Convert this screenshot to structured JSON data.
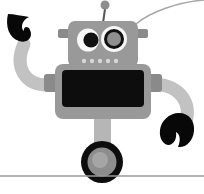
{
  "image": {
    "title": "Cartoon robot on one wheel",
    "subject": "robot",
    "width": 204,
    "height": 194,
    "background_color": "#ffffff",
    "style": "flat grayscale vector illustration"
  },
  "palette": {
    "background": "#ffffff",
    "body_gray": "#999999",
    "body_gray_dark": "#8a8a8a",
    "limb_gray": "#c2c2c2",
    "limb_gray_dark": "#b0b0b0",
    "screen_black": "#0d0d0d",
    "claw_black": "#080808",
    "eye_white": "#f7f7f7",
    "pupil_black": "#111111",
    "lens_gray": "#8f8f8f",
    "dot_gray": "#d6d6d6",
    "wheel_tire": "#0d0d0d",
    "wheel_hub": "#8d8d8d",
    "wheel_hub_light": "#a5a5a5",
    "ground_line": "#9a9a9a",
    "wire_gray": "#a8a8a8",
    "antenna_stem": "#555555",
    "antenna_ball": "#8d8d8d"
  },
  "parts": {
    "antenna": {
      "label": "antenna",
      "ball_cx": 105,
      "ball_cy": 5,
      "ball_r": 4.5,
      "stem_x1": 105,
      "stem_y1": 9,
      "stem_x2": 103,
      "stem_y2": 22
    },
    "wire": {
      "label": "background wire curve",
      "path": "M 204 0 C 178 2 150 12 136 24"
    },
    "head": {
      "label": "head",
      "x": 68,
      "y": 21,
      "width": 70,
      "height": 45,
      "radius": 7
    },
    "head_ears": {
      "label": "head side ears",
      "left": {
        "x": 58,
        "y": 29,
        "width": 11,
        "height": 9
      },
      "right": {
        "x": 137,
        "y": 29,
        "width": 11,
        "height": 9
      }
    },
    "eye_left": {
      "label": "left eye",
      "sclera_cx": 88,
      "sclera_cy": 40,
      "sclera_rx": 11,
      "sclera_ry": 11.5,
      "pupil_cx": 91,
      "pupil_cy": 40,
      "pupil_r": 7.5
    },
    "eye_right": {
      "label": "right eye lens",
      "cx": 114,
      "cy": 39,
      "outer_r": 13,
      "ring_r": 10,
      "inner_r": 7
    },
    "mouth_dots": {
      "label": "face indicator lights",
      "count": 5,
      "radius": 2.2,
      "y": 61,
      "xs": [
        84,
        92,
        100,
        108,
        116
      ]
    },
    "torso": {
      "label": "torso",
      "x": 55,
      "y": 64,
      "width": 96,
      "height": 55,
      "radius": 8
    },
    "shoulder_left": {
      "label": "left shoulder joint",
      "x": 44,
      "y": 74,
      "width": 13,
      "height": 18
    },
    "shoulder_right": {
      "label": "right shoulder joint",
      "x": 149,
      "y": 74,
      "width": 13,
      "height": 18
    },
    "screen": {
      "label": "chest screen",
      "x": 62,
      "y": 70,
      "width": 82,
      "height": 36,
      "radius": 4
    },
    "arm_left": {
      "label": "left arm raised",
      "path": "M 49 85 C 24 86 14 66 24 44",
      "stroke_width": 13
    },
    "claw_left": {
      "label": "left claw hook",
      "path": "M 8 14 C 5 26 9 38 19 41 C 29 44 33 36 30 30 C 28 25 23 27 24 31 C 20 28 22 20 29 17 C 22 16 14 14 8 14 Z"
    },
    "arm_right": {
      "label": "right arm lowered",
      "path": "M 155 84 C 182 86 191 104 186 122",
      "stroke_width": 13
    },
    "claw_right": {
      "label": "right claw pincer",
      "path": "M 179 113 C 189 113 195 121 194 131 C 193 141 186 148 178 147 C 181 140 180 134 176 132 C 177 139 174 144 169 145 C 163 145 159 138 160 130 C 161 121 169 113 179 113 Z"
    },
    "leg": {
      "label": "leg stem",
      "x": 94,
      "y": 118,
      "width": 17,
      "height": 32
    },
    "wheel": {
      "label": "wheel",
      "cx": 102,
      "cy": 162,
      "tire_r": 21,
      "hub_r": 14.5,
      "hub_light_r": 8
    },
    "ground": {
      "label": "ground line",
      "x1": 0,
      "y1": 176,
      "x2": 204,
      "y2": 176,
      "stroke_width": 1.6
    }
  }
}
